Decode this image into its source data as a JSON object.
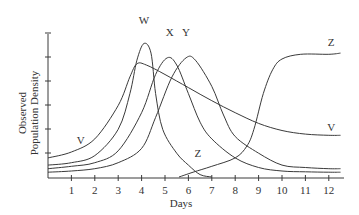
{
  "chart_data": {
    "type": "line",
    "title": "",
    "xlabel": "Days",
    "ylabel": [
      "Observed",
      "Population Density"
    ],
    "xlim": [
      0,
      12.5
    ],
    "ylim": [
      0,
      6
    ],
    "x_ticks": [
      "1",
      "2",
      "3",
      "4",
      "5",
      "6",
      "7",
      "8",
      "9",
      "10",
      "11",
      "12"
    ],
    "y_ticks_count": 6,
    "y_tick_labels": false,
    "grid": false,
    "legend": "none (curves labeled inline)",
    "series": [
      {
        "name": "V",
        "points": [
          [
            0,
            0.8
          ],
          [
            1,
            1.05
          ],
          [
            2,
            1.6
          ],
          [
            3,
            3.0
          ],
          [
            3.5,
            4.2
          ],
          [
            3.8,
            4.75
          ],
          [
            4.2,
            4.7
          ],
          [
            5,
            4.3
          ],
          [
            6,
            3.75
          ],
          [
            7,
            3.2
          ],
          [
            8,
            2.7
          ],
          [
            9,
            2.25
          ],
          [
            10,
            1.95
          ],
          [
            11,
            1.8
          ],
          [
            12,
            1.75
          ],
          [
            12.5,
            1.75
          ]
        ],
        "label_pos": [
          1.4,
          1.4
        ]
      },
      {
        "name": "W",
        "points": [
          [
            0,
            0.5
          ],
          [
            1,
            0.6
          ],
          [
            2,
            0.9
          ],
          [
            3,
            2.0
          ],
          [
            3.5,
            3.5
          ],
          [
            3.8,
            4.9
          ],
          [
            4.1,
            5.6
          ],
          [
            4.4,
            5.2
          ],
          [
            4.6,
            3.5
          ],
          [
            4.9,
            2.0
          ],
          [
            5.5,
            1.0
          ],
          [
            6,
            0.5
          ],
          [
            6.5,
            0.1
          ],
          [
            7,
            0.0
          ]
        ],
        "label_pos": [
          4.1,
          6.4
        ]
      },
      {
        "name": "X",
        "points": [
          [
            0,
            0.35
          ],
          [
            1,
            0.45
          ],
          [
            2,
            0.6
          ],
          [
            3,
            1.1
          ],
          [
            4,
            2.7
          ],
          [
            4.6,
            4.3
          ],
          [
            5.1,
            5.0
          ],
          [
            5.5,
            4.7
          ],
          [
            6,
            3.5
          ],
          [
            6.5,
            2.3
          ],
          [
            7,
            1.6
          ],
          [
            8,
            0.8
          ],
          [
            9,
            0.4
          ],
          [
            10,
            0.25
          ],
          [
            11,
            0.22
          ],
          [
            12,
            0.2
          ],
          [
            12.5,
            0.2
          ]
        ],
        "label_pos": [
          5.2,
          5.9
        ]
      },
      {
        "name": "Y",
        "points": [
          [
            0,
            0.2
          ],
          [
            1,
            0.25
          ],
          [
            2,
            0.35
          ],
          [
            3,
            0.6
          ],
          [
            4,
            1.2
          ],
          [
            4.6,
            2.5
          ],
          [
            5.3,
            4.2
          ],
          [
            5.9,
            5.0
          ],
          [
            6.3,
            4.9
          ],
          [
            7,
            3.8
          ],
          [
            7.5,
            2.6
          ],
          [
            8,
            1.7
          ],
          [
            9,
            1.0
          ],
          [
            10,
            0.5
          ],
          [
            11,
            0.4
          ],
          [
            12,
            0.35
          ],
          [
            12.5,
            0.35
          ]
        ],
        "label_pos": [
          5.9,
          5.9
        ]
      },
      {
        "name": "Z",
        "points": [
          [
            5.6,
            0.0
          ],
          [
            6.2,
            0.2
          ],
          [
            7,
            0.45
          ],
          [
            8,
            0.8
          ],
          [
            8.5,
            1.3
          ],
          [
            8.8,
            2.0
          ],
          [
            9.2,
            3.5
          ],
          [
            9.6,
            4.5
          ],
          [
            10,
            4.95
          ],
          [
            10.8,
            5.15
          ],
          [
            12,
            5.15
          ],
          [
            12.5,
            5.2
          ]
        ],
        "label_pos": [
          6.4,
          0.85
        ]
      }
    ],
    "annotations": [
      {
        "text": "Z",
        "note": "right label near plateau",
        "pos": [
          12.1,
          5.5
        ]
      },
      {
        "text": "V",
        "note": "right label near tail",
        "pos": [
          12.1,
          1.95
        ]
      }
    ]
  }
}
